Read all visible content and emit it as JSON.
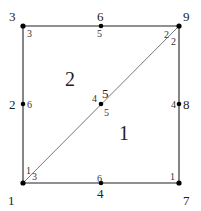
{
  "diagram": {
    "type": "finite-element-mesh",
    "global_nodes": [
      {
        "id": "1",
        "label": "1",
        "x": 23,
        "y": 183
      },
      {
        "id": "2",
        "label": "2",
        "x": 23,
        "y": 104
      },
      {
        "id": "3",
        "label": "3",
        "x": 23,
        "y": 26
      },
      {
        "id": "4",
        "label": "4",
        "x": 101,
        "y": 183
      },
      {
        "id": "5",
        "label": "5",
        "x": 101,
        "y": 104
      },
      {
        "id": "6",
        "label": "6",
        "x": 101,
        "y": 26
      },
      {
        "id": "7",
        "label": "7",
        "x": 179,
        "y": 183
      },
      {
        "id": "8",
        "label": "8",
        "x": 179,
        "y": 104
      },
      {
        "id": "9",
        "label": "9",
        "x": 179,
        "y": 26
      }
    ],
    "elements": [
      {
        "id": "1",
        "label": "1",
        "nodes": [
          "1",
          "7",
          "9",
          "4",
          "8",
          "5"
        ]
      },
      {
        "id": "2",
        "label": "2",
        "nodes": [
          "9",
          "3",
          "1",
          "6",
          "2",
          "5"
        ]
      }
    ],
    "labels": {
      "global": {
        "n1": "1",
        "n2": "2",
        "n3": "3",
        "n4": "4",
        "n5": "5",
        "n6": "6",
        "n7": "7",
        "n8": "8",
        "n9": "9"
      },
      "elem1_local": {
        "at1": "3",
        "at7": "1",
        "at9": "2",
        "at4": "6",
        "at8": "4",
        "at5": "5"
      },
      "elem2_local": {
        "at1": "1",
        "at3": "3",
        "at9": "2",
        "at6": "5",
        "at2": "6",
        "at5": "4"
      },
      "element_ids": {
        "e1": "1",
        "e2": "2"
      }
    }
  }
}
